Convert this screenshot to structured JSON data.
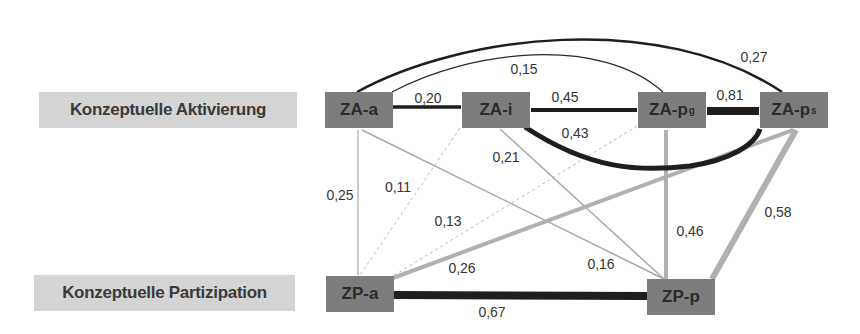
{
  "row_labels": {
    "activation": "Konzeptuelle Aktivierung",
    "participation": "Konzeptuelle Partizipation"
  },
  "nodes": {
    "za_a": {
      "label": "ZA-a",
      "sub": ""
    },
    "za_i": {
      "label": "ZA-i",
      "sub": ""
    },
    "za_pg": {
      "label": "ZA-p",
      "sub": "g"
    },
    "za_ps": {
      "label": "ZA-p",
      "sub": "s"
    },
    "zp_a": {
      "label": "ZP-a",
      "sub": ""
    },
    "zp_p": {
      "label": "ZP-p",
      "sub": ""
    }
  },
  "edges": [
    {
      "id": "za_a-za_i",
      "from": "ZA-a",
      "to": "ZA-i",
      "value": "0,20",
      "style": "dark-medium"
    },
    {
      "id": "za_i-za_pg",
      "from": "ZA-i",
      "to": "ZA-pg",
      "value": "0,45",
      "style": "dark-medium"
    },
    {
      "id": "za_pg-za_ps",
      "from": "ZA-pg",
      "to": "ZA-ps",
      "value": "0,81",
      "style": "dark-thick"
    },
    {
      "id": "za_a-za_pg",
      "from": "ZA-a",
      "to": "ZA-pg",
      "value": "0,15",
      "style": "dark-thin-arc"
    },
    {
      "id": "za_a-za_ps",
      "from": "ZA-a",
      "to": "ZA-ps",
      "value": "0,27",
      "style": "dark-arc"
    },
    {
      "id": "za_i-za_ps",
      "from": "ZA-i",
      "to": "ZA-ps",
      "value": "0,43",
      "style": "dark-thick-arc"
    },
    {
      "id": "za_a-zp_a",
      "from": "ZA-a",
      "to": "ZP-a",
      "value": "0,25",
      "style": "gray-thin"
    },
    {
      "id": "za_i-zp_a",
      "from": "ZA-i",
      "to": "ZP-a",
      "value": "0,11",
      "style": "gray-dotted"
    },
    {
      "id": "za_pg-zp_a",
      "from": "ZA-pg",
      "to": "ZP-a",
      "value": "0,13",
      "style": "gray-dotted"
    },
    {
      "id": "za_ps-zp_a",
      "from": "ZA-ps",
      "to": "ZP-a",
      "value": "0,26",
      "style": "gray-medium"
    },
    {
      "id": "za_i-zp_p",
      "from": "ZA-i",
      "to": "ZP-p",
      "value": "0,21",
      "style": "gray-thin"
    },
    {
      "id": "za_a-zp_p",
      "from": "ZA-a",
      "to": "ZP-p",
      "value": "0,16",
      "style": "gray-thin"
    },
    {
      "id": "za_pg-zp_p",
      "from": "ZA-pg",
      "to": "ZP-p",
      "value": "0,46",
      "style": "gray-medium"
    },
    {
      "id": "za_ps-zp_p",
      "from": "ZA-ps",
      "to": "ZP-p",
      "value": "0,58",
      "style": "gray-thick"
    },
    {
      "id": "zp_a-zp_p",
      "from": "ZP-a",
      "to": "ZP-p",
      "value": "0,67",
      "style": "dark-thick"
    }
  ],
  "colors": {
    "dark_edge": "#1e1e1e",
    "gray_edge": "#b0b0b0",
    "node_fill": "#7d7d7d",
    "label_fill": "#d4d4d4"
  }
}
